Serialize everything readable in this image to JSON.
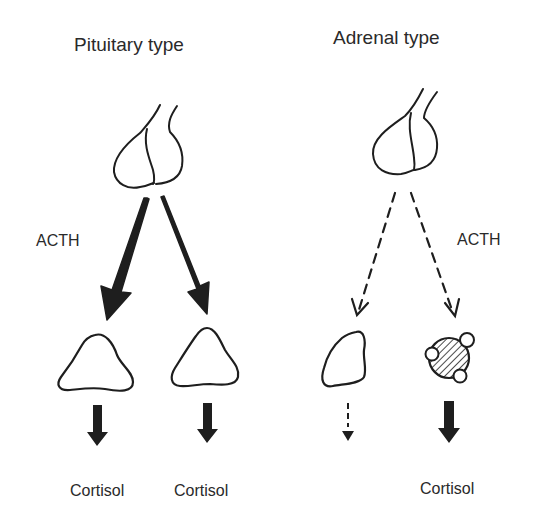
{
  "panels": {
    "pituitary": {
      "title": "Pituitary type",
      "hormone_label": "ACTH",
      "outputs": [
        "Cortisol",
        "Cortisol"
      ]
    },
    "adrenal": {
      "title": "Adrenal type",
      "hormone_label": "ACTH",
      "outputs": [
        "Cortisol"
      ]
    }
  },
  "colors": {
    "ink": "#1e1e1e",
    "background": "#ffffff"
  }
}
